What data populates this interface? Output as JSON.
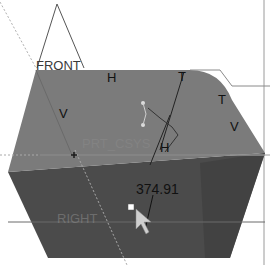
{
  "viewport": {
    "background": "#ffffff",
    "top_face_color": "#7b7b7b",
    "front_face_color": "#4b4b4b",
    "right_shade_color": "#3c3c3c"
  },
  "datum_planes": {
    "front": "FRONT",
    "right": "RIGHT"
  },
  "coordinate_system": {
    "label": "PRT_CSYS"
  },
  "constraints": {
    "h_top": "H",
    "v_left": "V",
    "t_top_right": "T",
    "t_right": "T",
    "v_right": "V",
    "h_center": "H"
  },
  "dimension": {
    "value": "374.91"
  },
  "cursor": {
    "type": "arrow-pointer"
  }
}
